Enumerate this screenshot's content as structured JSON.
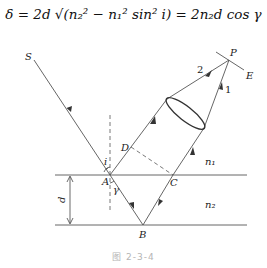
{
  "formula": {
    "text": "δ = 2d √(n₂² − n₁² sin² i) = 2n₂d cos γ"
  },
  "diagram": {
    "points": {
      "S": "S",
      "P": "P",
      "E": "E",
      "A": "A",
      "B": "B",
      "C": "C",
      "D": "D"
    },
    "rays": {
      "ray1": "1",
      "ray2": "2"
    },
    "media": {
      "upper": "n₁",
      "film": "n₂"
    },
    "angles": {
      "incidence": "i",
      "refraction": "γ"
    },
    "thickness": "d"
  },
  "caption": "图  2-3-4"
}
